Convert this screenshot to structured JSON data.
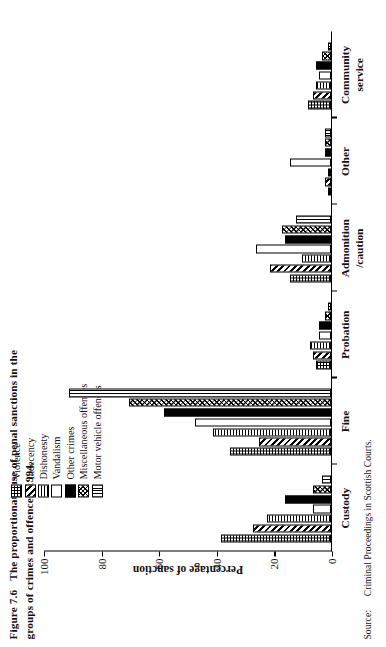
{
  "figure": {
    "number": "Figure 7.6",
    "title": "The proportionate use of penal sanctions in the groups of crimes and offences, 1994."
  },
  "source": {
    "label": "Source:",
    "text": "Criminal Proceedings in Scottish Courts."
  },
  "axis": {
    "ylabel": "Percentage of sanction",
    "ticks": [
      "100",
      "80",
      "60",
      "40",
      "20",
      "0"
    ]
  },
  "legend": {
    "items": [
      {
        "label": "Violence",
        "pattern": "p-violence",
        "swatch_name": "legend-swatch-violence"
      },
      {
        "label": "Indecency",
        "pattern": "p-indecency",
        "swatch_name": "legend-swatch-indecency"
      },
      {
        "label": "Dishonesty",
        "pattern": "p-dishonesty",
        "swatch_name": "legend-swatch-dishonesty"
      },
      {
        "label": "Vandalism",
        "pattern": "p-vandalism",
        "swatch_name": "legend-swatch-vandalism"
      },
      {
        "label": "Other crimes",
        "pattern": "p-other",
        "swatch_name": "legend-swatch-other-crimes"
      },
      {
        "label": "Miscellaneous offences",
        "pattern": "p-misc",
        "swatch_name": "legend-swatch-miscellaneous"
      },
      {
        "label": "Motor vehicle offences",
        "pattern": "p-motor",
        "swatch_name": "legend-swatch-motor-vehicle"
      }
    ]
  },
  "chart_data": {
    "type": "bar",
    "title": "The proportionate use of penal sanctions in the groups of crimes and offences, 1994.",
    "xlabel": "",
    "ylabel": "Percentage of sanction",
    "ylim": [
      0,
      100
    ],
    "grid": false,
    "legend_position": "top-right",
    "categories": [
      "Custody",
      "Fine",
      "Probation",
      "Admonition\n/caution",
      "Other",
      "Community\nservice"
    ],
    "series": [
      {
        "name": "Violence",
        "values": [
          38,
          35,
          5,
          14,
          1,
          8
        ]
      },
      {
        "name": "Indecency",
        "values": [
          27,
          25,
          6,
          21,
          2,
          6
        ]
      },
      {
        "name": "Dishonesty",
        "values": [
          22,
          41,
          7,
          10,
          1,
          5
        ]
      },
      {
        "name": "Vandalism",
        "values": [
          6,
          47,
          4,
          26,
          14,
          4
        ]
      },
      {
        "name": "Other crimes",
        "values": [
          16,
          58,
          4,
          16,
          2,
          5
        ]
      },
      {
        "name": "Miscellaneous offences",
        "values": [
          6,
          70,
          2,
          17,
          2,
          3
        ]
      },
      {
        "name": "Motor vehicle offences",
        "values": [
          3,
          91,
          1,
          12,
          2,
          1
        ]
      }
    ]
  }
}
